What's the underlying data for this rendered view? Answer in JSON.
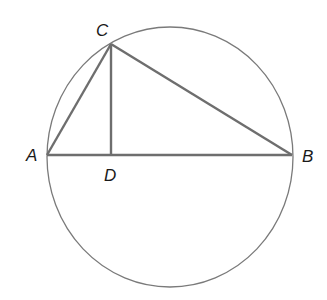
{
  "diagram": {
    "type": "geometry",
    "points": {
      "A": {
        "label": "A",
        "x": 47,
        "y": 155
      },
      "B": {
        "label": "B",
        "x": 292,
        "y": 155
      },
      "C": {
        "label": "C",
        "x": 111,
        "y": 44
      },
      "D": {
        "label": "D",
        "x": 111,
        "y": 155
      }
    },
    "circle": {
      "cx": 170,
      "cy": 157,
      "rx": 123,
      "ry": 130
    },
    "segments": [
      "AB",
      "AC",
      "BC",
      "CD"
    ],
    "colors": {
      "circle": "#7a7a7a",
      "segments": "#6e6e6e",
      "labels": "#1a1a1a"
    }
  }
}
